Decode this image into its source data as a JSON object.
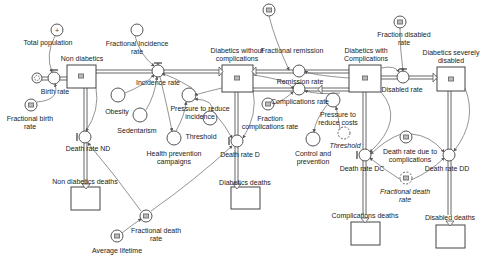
{
  "diagram": {
    "type": "stock-and-flow",
    "stocks": [
      {
        "id": "non_diabetics",
        "label": "Non diabetics"
      },
      {
        "id": "diabetics_without_complications",
        "label": "Diabetics without complications"
      },
      {
        "id": "diabetics_with_complications",
        "label": "Diabetics with Complications"
      },
      {
        "id": "diabetics_severely_disabled",
        "label": "Diabetics severely disabled"
      },
      {
        "id": "non_diabetics_deaths",
        "label": "Non diabetics deaths"
      },
      {
        "id": "diabetics_deaths",
        "label": "Diabetics deaths"
      },
      {
        "id": "complications_deaths",
        "label": "Complications deaths"
      },
      {
        "id": "disabled_deaths",
        "label": "Disabled deaths"
      }
    ],
    "flows": [
      {
        "id": "birth_rate",
        "label": "Birth rate"
      },
      {
        "id": "incidence_rate",
        "label": "Incidence rate"
      },
      {
        "id": "remission_rate",
        "label": "Remission rate"
      },
      {
        "id": "fractional_remission",
        "label": "Fractional remission"
      },
      {
        "id": "complications_rate",
        "label": "Complications rate"
      },
      {
        "id": "disabled_rate",
        "label": "Disabled rate"
      },
      {
        "id": "death_rate_nd",
        "label": "Death rate ND"
      },
      {
        "id": "death_rate_d",
        "label": "Death rate D"
      },
      {
        "id": "death_rate_dc",
        "label": "Death rate DC"
      },
      {
        "id": "death_rate_dd",
        "label": "Death rate DD"
      }
    ],
    "auxiliaries": [
      {
        "id": "total_population",
        "label": "Total population"
      },
      {
        "id": "fractional_birth_rate",
        "label": "Fractional birth rate"
      },
      {
        "id": "fractional_incidence_rate",
        "label": "Fractional Incidence rate"
      },
      {
        "id": "obesity",
        "label": "Obesity"
      },
      {
        "id": "sedentarism",
        "label": "Sedentarism"
      },
      {
        "id": "pressure_to_reduce_incidence",
        "label": "Pressure to reduce incidence"
      },
      {
        "id": "health_prevention_campaigns",
        "label": "Health prevention campaigns"
      },
      {
        "id": "threshold",
        "label": "Threshold"
      },
      {
        "id": "fraction_complications_rate",
        "label": "Fraction complications rate"
      },
      {
        "id": "pressure_to_reduce_costs",
        "label": "Pressure to reduce costs"
      },
      {
        "id": "control_and_prevention",
        "label": "Control and prevention"
      },
      {
        "id": "threshold_shadow",
        "label": "Threshold"
      },
      {
        "id": "fraction_disabled_rate",
        "label": "Fraction disabled rate"
      },
      {
        "id": "death_rate_due_to_complications",
        "label": "Death rate due to complications"
      },
      {
        "id": "fractional_death_rate_shadow",
        "label": "Fractional death rate"
      },
      {
        "id": "fractional_death_rate",
        "label": "Fractional death rate"
      },
      {
        "id": "average_lifetime",
        "label": "Average lifetime"
      }
    ]
  }
}
